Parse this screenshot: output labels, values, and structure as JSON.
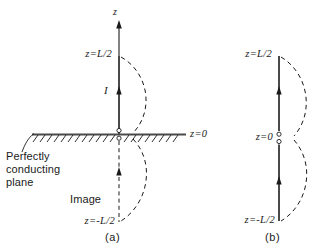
{
  "figure": {
    "background_color": "#ffffff",
    "ink_color": "#1a1a1a",
    "panels": [
      {
        "tag": "(a)",
        "description": "Antenna above perfectly conducting plane with its image",
        "labels": {
          "axis": "z",
          "top_coordinate": "z=L/2",
          "current": "I",
          "plane_coordinate": "z=0",
          "plane_caption_line1": "Perfectly",
          "plane_caption_line2": "conducting",
          "plane_caption_line3": "plane",
          "image_label": "Image",
          "bottom_coordinate": "z=-L/2"
        }
      },
      {
        "tag": "(b)",
        "description": "Equivalent free-space dipole of length L fed at its center",
        "labels": {
          "top_coordinate": "z=L/2",
          "feed_coordinate": "z=0",
          "bottom_coordinate": "z=-L/2"
        }
      }
    ]
  },
  "panel_a": {
    "axis_label": "z",
    "top_coord": "z=L/2",
    "current_label": "I",
    "plane_coord": "z=0",
    "caption_l1": "Perfectly",
    "caption_l2": "conducting",
    "caption_l3": "plane",
    "image_label": "Image",
    "bottom_coord": "z=-L/2",
    "tag": "(a)"
  },
  "panel_b": {
    "top_coord": "z=L/2",
    "feed_coord": "z=0",
    "bottom_coord": "z=-L/2",
    "tag": "(b)"
  }
}
